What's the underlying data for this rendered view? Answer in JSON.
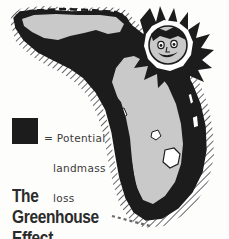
{
  "illustration": {
    "subject": "Map of Florida showing potential landmass loss",
    "background_color": "#fdfdfb",
    "loss_color": "#1c1c1c",
    "land_color": "#c9c9c9",
    "hatch_color": "#4a4a4a",
    "outline_color": "#1c1c1c"
  },
  "title": {
    "line1": "The Greenhouse",
    "line2": "Effect"
  },
  "legend": {
    "swatch_color": "#1c1c1c",
    "line1": "= Potential",
    "line2": "landmass",
    "line3": "loss"
  },
  "map_features": {
    "state_border": "dashed northern state line",
    "sun": "sun face with spiky rays over northeast Florida",
    "keys": "dashed island chain at southern tip"
  }
}
